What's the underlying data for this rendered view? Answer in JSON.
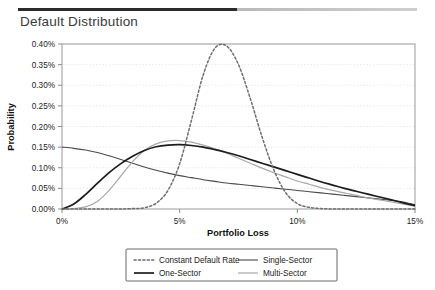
{
  "header": {
    "title": "Default Distribution"
  },
  "chart_data": {
    "type": "line",
    "title": "Default Distribution",
    "xlabel": "Portfolio Loss",
    "ylabel": "Probability",
    "xlim": [
      0,
      15
    ],
    "ylim": [
      0,
      0.4
    ],
    "xtick_labels": [
      "0%",
      "5%",
      "10%",
      "15%"
    ],
    "xticks": [
      0,
      5,
      10,
      15
    ],
    "ytick_labels": [
      "0.00%",
      "0.05%",
      "0.10%",
      "0.15%",
      "0.20%",
      "0.25%",
      "0.30%",
      "0.35%",
      "0.40%"
    ],
    "yticks": [
      0.0,
      0.05,
      0.1,
      0.15,
      0.2,
      0.25,
      0.3,
      0.35,
      0.4
    ],
    "grid": "horizontal-dotted",
    "legend_position": "below-center",
    "legend_columns": 2,
    "x": [
      0,
      0.5,
      1,
      1.5,
      2,
      2.5,
      3,
      3.5,
      4,
      4.5,
      5,
      5.5,
      6,
      6.5,
      7,
      7.5,
      8,
      8.5,
      9,
      9.5,
      10,
      10.5,
      11,
      11.5,
      12,
      12.5,
      13,
      13.5,
      14,
      14.5,
      15
    ],
    "series": [
      {
        "name": "Constant Default Rate",
        "style": "dotted",
        "color": "#6e6e6e",
        "values": [
          0.0,
          0.0,
          0.0,
          0.0,
          0.0,
          0.0,
          0.001,
          0.003,
          0.014,
          0.045,
          0.11,
          0.215,
          0.325,
          0.39,
          0.395,
          0.35,
          0.268,
          0.175,
          0.095,
          0.04,
          0.013,
          0.004,
          0.001,
          0.0,
          0.0,
          0.0,
          0.0,
          0.0,
          0.0,
          0.0,
          0.0
        ]
      },
      {
        "name": "One-Sector",
        "style": "solid-thick",
        "color": "#1c1c1c",
        "values": [
          0.0,
          0.012,
          0.035,
          0.062,
          0.088,
          0.11,
          0.128,
          0.142,
          0.151,
          0.155,
          0.156,
          0.154,
          0.15,
          0.144,
          0.137,
          0.129,
          0.12,
          0.111,
          0.102,
          0.093,
          0.084,
          0.075,
          0.066,
          0.058,
          0.05,
          0.043,
          0.036,
          0.029,
          0.022,
          0.015,
          0.008
        ]
      },
      {
        "name": "Single-Sector",
        "style": "solid",
        "color": "#4a4a4a",
        "values": [
          0.15,
          0.147,
          0.143,
          0.137,
          0.129,
          0.12,
          0.111,
          0.102,
          0.094,
          0.087,
          0.081,
          0.076,
          0.071,
          0.067,
          0.063,
          0.06,
          0.057,
          0.054,
          0.051,
          0.048,
          0.045,
          0.042,
          0.039,
          0.036,
          0.033,
          0.03,
          0.027,
          0.024,
          0.021,
          0.017,
          0.01
        ]
      },
      {
        "name": "Multi-Sector",
        "style": "solid-light",
        "color": "#a8a8a8",
        "values": [
          0.0,
          0.001,
          0.005,
          0.018,
          0.045,
          0.08,
          0.115,
          0.142,
          0.158,
          0.165,
          0.166,
          0.162,
          0.155,
          0.146,
          0.135,
          0.123,
          0.111,
          0.099,
          0.088,
          0.078,
          0.068,
          0.06,
          0.052,
          0.045,
          0.039,
          0.033,
          0.027,
          0.022,
          0.017,
          0.012,
          0.007
        ]
      }
    ],
    "legend": [
      {
        "label": "Constant Default Rate",
        "style": "dotted"
      },
      {
        "label": "Single-Sector",
        "style": "solid"
      },
      {
        "label": "One-Sector",
        "style": "solid-thick"
      },
      {
        "label": "Multi-Sector",
        "style": "solid-light"
      }
    ]
  }
}
